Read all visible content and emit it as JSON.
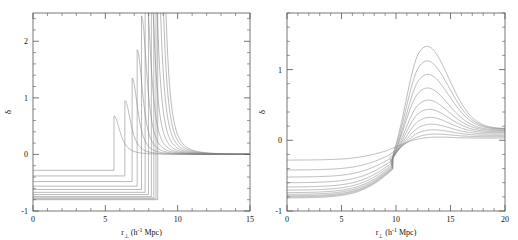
{
  "figure": {
    "background": "#ffffff",
    "line_color": "#808080",
    "axis_color": "#555555",
    "text_color": "#111111"
  },
  "chart_data": [
    {
      "type": "line",
      "panel": "left",
      "title": "",
      "xlabel": "r⊥ (h⁻¹ Mpc)",
      "ylabel": "δ",
      "xlim": [
        0,
        15
      ],
      "ylim": [
        -1,
        2.5
      ],
      "xticks": [
        0,
        5,
        10,
        15
      ],
      "xtick_labels": [
        "0",
        "5",
        "10",
        "15"
      ],
      "yticks": [
        -1,
        0,
        1,
        2
      ],
      "ytick_labels": [
        "-1",
        "0",
        "1",
        "2"
      ],
      "minor_xticks": 5,
      "minor_yticks": 5,
      "grid": false,
      "legend": "none",
      "description": "Top-hat underdensity profiles: constant negative delta inside void radius, sharp caustic spike at the void edge, decaying to zero outside.",
      "series": [
        {
          "name": "curve-1",
          "delta_in": -0.28,
          "r_edge": 5.6,
          "spike_peak": 0.68,
          "tail_decay": 1.55
        },
        {
          "name": "curve-2",
          "delta_in": -0.38,
          "r_edge": 6.35,
          "spike_peak": 0.95,
          "tail_decay": 1.5
        },
        {
          "name": "curve-3",
          "delta_in": -0.48,
          "r_edge": 6.85,
          "spike_peak": 1.35,
          "tail_decay": 1.45
        },
        {
          "name": "curve-4",
          "delta_in": -0.56,
          "r_edge": 7.2,
          "spike_peak": 1.85,
          "tail_decay": 1.4
        },
        {
          "name": "curve-5",
          "delta_in": -0.62,
          "r_edge": 7.5,
          "spike_peak": 2.45,
          "tail_decay": 1.35
        },
        {
          "name": "curve-6",
          "delta_in": -0.67,
          "r_edge": 7.75,
          "spike_peak": 3.2,
          "tail_decay": 1.3
        },
        {
          "name": "curve-7",
          "delta_in": -0.71,
          "r_edge": 7.98,
          "spike_peak": 4.1,
          "tail_decay": 1.26
        },
        {
          "name": "curve-8",
          "delta_in": -0.745,
          "r_edge": 8.18,
          "spike_peak": 5.2,
          "tail_decay": 1.22
        },
        {
          "name": "curve-9",
          "delta_in": -0.768,
          "r_edge": 8.35,
          "spike_peak": 6.5,
          "tail_decay": 1.19
        },
        {
          "name": "curve-10",
          "delta_in": -0.785,
          "r_edge": 8.5,
          "spike_peak": 8.0,
          "tail_decay": 1.16
        },
        {
          "name": "curve-11",
          "delta_in": -0.8,
          "r_edge": 8.62,
          "spike_peak": 9.5,
          "tail_decay": 1.14
        }
      ]
    },
    {
      "type": "line",
      "panel": "right",
      "title": "",
      "xlabel": "r⊥ (h⁻¹ Mpc)",
      "ylabel": "δ",
      "xlim": [
        0,
        20
      ],
      "ylim": [
        -1,
        1.8
      ],
      "xticks": [
        0,
        5,
        10,
        15,
        20
      ],
      "xtick_labels": [
        "0",
        "5",
        "10",
        "15",
        "20"
      ],
      "yticks": [
        -1,
        0,
        1
      ],
      "ytick_labels": [
        "-1",
        "0",
        "1"
      ],
      "minor_xticks": 5,
      "minor_yticks": 5,
      "grid": false,
      "legend": "none",
      "description": "Smoothed (projected) void profiles: smooth rise from negative central delta through zero near r=9.5, peaking near r=12, then slowly declining toward a small positive asymptote.",
      "series": [
        {
          "name": "curve-1",
          "delta_0": -0.28,
          "zero_cross": 9.3,
          "peak_r": 12.0,
          "peak_delta": 0.06,
          "tail_delta": 0.035
        },
        {
          "name": "curve-2",
          "delta_0": -0.42,
          "zero_cross": 9.4,
          "peak_r": 12.0,
          "peak_delta": 0.12,
          "tail_delta": 0.055
        },
        {
          "name": "curve-3",
          "delta_0": -0.52,
          "zero_cross": 9.45,
          "peak_r": 12.0,
          "peak_delta": 0.2,
          "tail_delta": 0.075
        },
        {
          "name": "curve-4",
          "delta_0": -0.6,
          "zero_cross": 9.5,
          "peak_r": 12.0,
          "peak_delta": 0.3,
          "tail_delta": 0.095
        },
        {
          "name": "curve-5",
          "delta_0": -0.66,
          "zero_cross": 9.55,
          "peak_r": 12.0,
          "peak_delta": 0.42,
          "tail_delta": 0.115
        },
        {
          "name": "curve-6",
          "delta_0": -0.705,
          "zero_cross": 9.58,
          "peak_r": 12.0,
          "peak_delta": 0.56,
          "tail_delta": 0.13
        },
        {
          "name": "curve-7",
          "delta_0": -0.74,
          "zero_cross": 9.62,
          "peak_r": 12.0,
          "peak_delta": 0.72,
          "tail_delta": 0.145
        },
        {
          "name": "curve-8",
          "delta_0": -0.765,
          "zero_cross": 9.65,
          "peak_r": 12.0,
          "peak_delta": 0.93,
          "tail_delta": 0.155
        },
        {
          "name": "curve-9",
          "delta_0": -0.785,
          "zero_cross": 9.68,
          "peak_r": 12.1,
          "peak_delta": 1.15,
          "tail_delta": 0.165
        },
        {
          "name": "curve-10",
          "delta_0": -0.8,
          "zero_cross": 9.7,
          "peak_r": 12.1,
          "peak_delta": 1.38,
          "tail_delta": 0.17
        },
        {
          "name": "curve-11",
          "delta_0": -0.815,
          "zero_cross": 9.72,
          "peak_r": 12.1,
          "peak_delta": 1.63,
          "tail_delta": 0.175
        }
      ]
    }
  ]
}
